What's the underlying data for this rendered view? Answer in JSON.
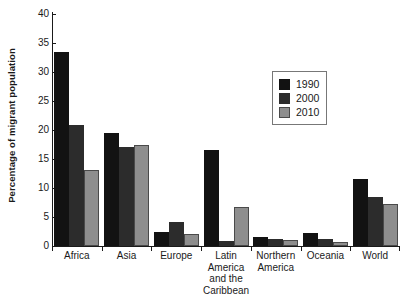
{
  "chart_data": {
    "type": "bar",
    "title": "",
    "xlabel": "",
    "ylabel": "Percentage of migrant population",
    "ylim": [
      0,
      40
    ],
    "yticks": [
      0,
      5,
      10,
      15,
      20,
      25,
      30,
      35,
      40
    ],
    "grid": false,
    "legend_position": "upper right",
    "categories": [
      "Africa",
      "Asia",
      "Europe",
      "Latin America and the Caribbean",
      "Northern America",
      "Oceania",
      "World"
    ],
    "category_lines": [
      [
        "Africa"
      ],
      [
        "Asia"
      ],
      [
        "Europe"
      ],
      [
        "Latin",
        "America",
        "and the",
        "Caribbean"
      ],
      [
        "Northern",
        "America"
      ],
      [
        "Oceania"
      ],
      [
        "World"
      ]
    ],
    "series": [
      {
        "name": "1990",
        "color": "#121212",
        "values": [
          33.5,
          19.5,
          2.5,
          16.5,
          1.5,
          2.3,
          11.5
        ]
      },
      {
        "name": "2000",
        "color": "#2c2c2c",
        "values": [
          20.9,
          17.0,
          4.1,
          0.8,
          1.2,
          1.2,
          8.4
        ]
      },
      {
        "name": "2010",
        "color": "#8e8e8e",
        "values": [
          13.1,
          17.5,
          2.0,
          6.8,
          1.0,
          0.7,
          7.3
        ]
      }
    ]
  }
}
